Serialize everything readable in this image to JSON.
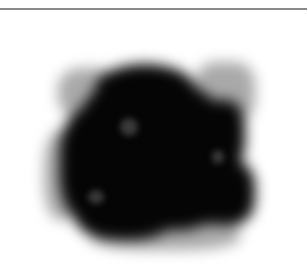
{
  "image": {
    "description": "Blurred dark ink-blot-like shape on a white background with a thin gray rule across the top",
    "subject": "dark-blob",
    "colors": {
      "background": "#ffffff",
      "blob": "#050505",
      "blob_haze": "#9a9a9a",
      "blob_highlight": "#3a3a3a",
      "top_rule": "#8a8a8a"
    }
  }
}
